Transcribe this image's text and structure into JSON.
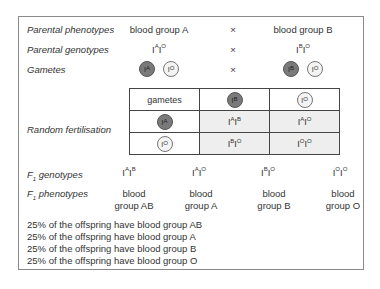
{
  "rows": {
    "parental_phenotypes": {
      "label": "Parental phenotypes",
      "left": "blood group A",
      "cross": "×",
      "right": "blood group B"
    },
    "parental_genotypes": {
      "label": "Parental genotypes",
      "left": {
        "base1": "I",
        "sup1": "A",
        "base2": "I",
        "sup2": "O"
      },
      "cross": "×",
      "right": {
        "base1": "I",
        "sup1": "B",
        "base2": "I",
        "sup2": "O"
      }
    },
    "gametes": {
      "label": "Gametes",
      "cross": "×",
      "left": [
        {
          "base": "I",
          "sup": "A",
          "tone": "dark"
        },
        {
          "base": "I",
          "sup": "O",
          "tone": "light"
        }
      ],
      "right": [
        {
          "base": "I",
          "sup": "B",
          "tone": "dark"
        },
        {
          "base": "I",
          "sup": "O",
          "tone": "light"
        }
      ]
    },
    "random_fertilisation": {
      "label": "Random fertilisation"
    }
  },
  "punnett": {
    "corner": "gametes",
    "col_headers": [
      {
        "base": "I",
        "sup": "B",
        "tone": "dark"
      },
      {
        "base": "I",
        "sup": "O",
        "tone": "light"
      }
    ],
    "row_headers": [
      {
        "base": "I",
        "sup": "A",
        "tone": "dark"
      },
      {
        "base": "I",
        "sup": "O",
        "tone": "light"
      }
    ],
    "cells": [
      [
        {
          "b1": "I",
          "s1": "A",
          "b2": "I",
          "s2": "B"
        },
        {
          "b1": "I",
          "s1": "A",
          "b2": "I",
          "s2": "O"
        }
      ],
      [
        {
          "b1": "I",
          "s1": "B",
          "b2": "I",
          "s2": "O"
        },
        {
          "b1": "I",
          "s1": "O",
          "b2": "I",
          "s2": "O"
        }
      ]
    ]
  },
  "f1": {
    "genotypes_label": {
      "pre": "F",
      "sub": "1",
      "post": " genotypes"
    },
    "phenotypes_label": {
      "pre": "F",
      "sub": "1",
      "post": " phenotypes"
    },
    "genotypes": [
      {
        "b1": "I",
        "s1": "A",
        "b2": "I",
        "s2": "B"
      },
      {
        "b1": "I",
        "s1": "A",
        "b2": "I",
        "s2": "O"
      },
      {
        "b1": "I",
        "s1": "B",
        "b2": "I",
        "s2": "O"
      },
      {
        "b1": "I",
        "s1": "O",
        "b2": "I",
        "s2": "O"
      }
    ],
    "phenotypes": [
      {
        "line1": "blood",
        "line2": "group AB"
      },
      {
        "line1": "blood",
        "line2": "group A"
      },
      {
        "line1": "blood",
        "line2": "group B"
      },
      {
        "line1": "blood",
        "line2": "group O"
      }
    ]
  },
  "summary": [
    "25% of the offspring have blood group AB",
    "25% of the offspring have blood group A",
    "25% of the offspring have blood group B",
    "25% of the offspring have blood group O"
  ],
  "colors": {
    "dark_gamete": "#7a7a7a",
    "light_gamete": "#f4f4f4",
    "shaded_cell": "#eeeeee",
    "border": "#8a8a8a"
  }
}
